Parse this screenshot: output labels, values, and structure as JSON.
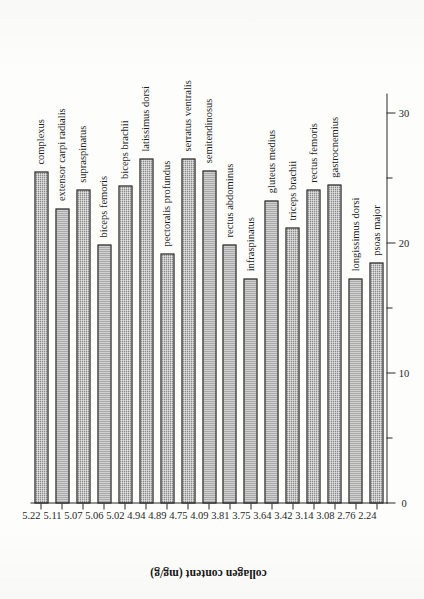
{
  "figure": {
    "caption_present": false
  },
  "chart_data": {
    "type": "bar",
    "orientation": "horizontal-rotated",
    "title": "",
    "xlabel": "collagen content (mg/g)",
    "ylabel": "compressive force (kg)",
    "value_axis": {
      "label": "compressive force (kg)",
      "ticks": [
        0,
        10,
        20,
        30
      ],
      "tick_labels": [
        "0",
        "10",
        "20",
        "30"
      ],
      "minor_ticks": [
        5,
        15,
        25
      ],
      "lim": [
        0,
        31.5
      ],
      "grid": false
    },
    "category_axis": {
      "label": "collagen content (mg/g)",
      "categories": [
        "5.22",
        "5.11",
        "5.07",
        "5.06",
        "5.02",
        "4.94",
        "4.89",
        "4.75",
        "4.09",
        "3.81",
        "3.75",
        "3.64",
        "3.42",
        "3.14",
        "3.08",
        "2.76",
        "2.24"
      ]
    },
    "categories": [
      "5.22",
      "5.11",
      "5.07",
      "5.06",
      "5.02",
      "4.94",
      "4.89",
      "4.75",
      "4.09",
      "3.81",
      "3.75",
      "3.64",
      "3.42",
      "3.14",
      "3.08",
      "2.76",
      "2.24"
    ],
    "values": [
      25.5,
      22.7,
      24.1,
      19.9,
      24.4,
      26.5,
      19.2,
      26.5,
      25.6,
      19.9,
      17.3,
      23.3,
      21.2,
      24.1,
      24.5,
      17.3,
      18.5
    ],
    "annotations": [
      "complexus",
      "extensor carpi radialis",
      "supraspinatus",
      "biceps femoris",
      "biceps brachii",
      "latissimus dorsi",
      "pectoralis profundus",
      "serratus ventralis",
      "semitendinosus",
      "rectus abdominus",
      "infraspinatus",
      "gluteus medius",
      "triceps brachii",
      "rectus femoris",
      "gastrocnemius",
      "longissimus dorsi",
      "psoas major"
    ],
    "legend": [],
    "bar_color": "#8a8a8a",
    "bar_edge_color": "#2b2b2b"
  }
}
